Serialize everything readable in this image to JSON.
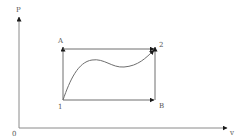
{
  "diagram": {
    "type": "pv-diagram",
    "colors": {
      "line": "#6e6e6e",
      "axis": "#8a8a8a",
      "arrow": "#1a1a1a",
      "label": "#555555",
      "background": "#ffffff"
    },
    "axes": {
      "y_label": "P",
      "x_label": "v",
      "origin_label": "0"
    },
    "points": {
      "A": "A",
      "two": "2",
      "one": "1",
      "B": "B"
    },
    "paths": [
      {
        "name": "1-A",
        "from": "1",
        "to": "A",
        "kind": "isochoric"
      },
      {
        "name": "A-2",
        "from": "A",
        "to": "2",
        "kind": "isobaric"
      },
      {
        "name": "1-B",
        "from": "1",
        "to": "B",
        "kind": "isobaric"
      },
      {
        "name": "B-2",
        "from": "B",
        "to": "2",
        "kind": "isochoric"
      },
      {
        "name": "1-2",
        "from": "1",
        "to": "2",
        "kind": "curve"
      }
    ]
  }
}
